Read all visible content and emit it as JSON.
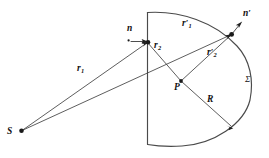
{
  "figure": {
    "background_color": "#ffffff",
    "line_color": "#3a3a3a",
    "label_color": "#111111",
    "width": 269,
    "height": 158
  },
  "points": {
    "source": {
      "name": "S",
      "label": "S",
      "x": 21,
      "y": 131
    },
    "field": {
      "name": "P",
      "label": "P",
      "x": 181,
      "y": 81
    },
    "plane_point": {
      "name": "plane-surface-point",
      "label": "",
      "x": 148,
      "y": 42
    },
    "arc_point": {
      "name": "arc-surface-point",
      "label": "",
      "x": 232,
      "y": 34
    },
    "radius_endpoint": {
      "name": "radius-arc-endpoint",
      "label": "",
      "x": 233,
      "y": 128
    }
  },
  "normals": {
    "n": {
      "label": "n",
      "prime": "",
      "x": 127,
      "y": 29
    },
    "n_prime": {
      "label": "n",
      "prime": "′",
      "x": 243,
      "y": 13
    }
  },
  "rays": {
    "r1": {
      "base": "r",
      "sub": "1",
      "prime": "",
      "x": 79,
      "y": 69
    },
    "r2": {
      "base": "r",
      "sub": "2",
      "prime": "",
      "x": 155,
      "y": 45
    },
    "r1_prime": {
      "base": "r",
      "sub": "1",
      "prime": "′",
      "x": 183,
      "y": 23
    },
    "r2_prime": {
      "base": "r",
      "sub": "2",
      "prime": "′",
      "x": 209,
      "y": 52
    },
    "R": {
      "base": "R",
      "sub": "",
      "prime": "",
      "x": 209,
      "y": 99
    }
  },
  "surface": {
    "sigma": {
      "label": "Σ",
      "x": 245,
      "y": 79
    }
  }
}
